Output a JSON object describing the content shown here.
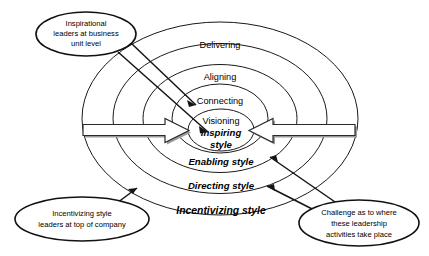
{
  "diagram": {
    "background_color": "#ffffff",
    "outline_color": "#1a1a1a",
    "rings": [
      {
        "id": "delivering",
        "label": "Delivering"
      },
      {
        "id": "aligning",
        "label": "Aligning"
      },
      {
        "id": "connecting",
        "label": "Connecting"
      },
      {
        "id": "visioning",
        "label": "Visioning"
      }
    ],
    "styles": [
      {
        "id": "inspiring",
        "label_line1": "Inspiring",
        "label_line2": "style"
      },
      {
        "id": "enabling",
        "label": "Enabling style"
      },
      {
        "id": "directing",
        "label": "Directing style"
      },
      {
        "id": "incentivizing",
        "label": "Incentivizing style"
      }
    ],
    "callouts": [
      {
        "id": "inspirational-leaders",
        "lines": [
          "Inspirational",
          "leaders at business",
          "unit level"
        ]
      },
      {
        "id": "incentivizing-leaders",
        "lines": [
          "Incentivizing style",
          "leaders at top of company"
        ]
      },
      {
        "id": "challenge",
        "lines": [
          "Challenge as to where",
          "these leadership",
          "activities take place"
        ]
      }
    ],
    "arrows": [
      {
        "id": "left-arrow",
        "direction": "right",
        "description": "block arrow pointing inward from left"
      },
      {
        "id": "right-arrow",
        "direction": "left",
        "description": "block arrow pointing inward from right"
      }
    ]
  }
}
